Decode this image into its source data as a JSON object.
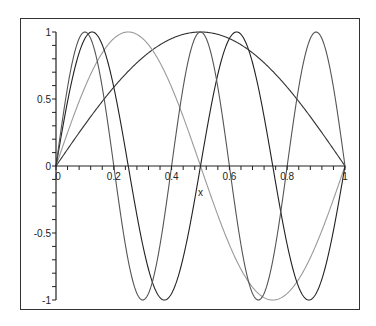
{
  "chart_data": {
    "type": "line",
    "title": "",
    "xlabel": "x",
    "ylabel": "",
    "xlim": [
      0,
      1
    ],
    "ylim": [
      -1,
      1
    ],
    "grid": false,
    "legend": null,
    "x_ticks": [
      {
        "value": 0,
        "label": "0"
      },
      {
        "value": 0.2,
        "label": "0.2"
      },
      {
        "value": 0.4,
        "label": "0.4"
      },
      {
        "value": 0.6,
        "label": "0.6"
      },
      {
        "value": 0.8,
        "label": "0.8"
      },
      {
        "value": 1,
        "label": "1"
      }
    ],
    "y_ticks": [
      {
        "value": 1,
        "label": "1"
      },
      {
        "value": 0.5,
        "label": "0.5"
      },
      {
        "value": 0,
        "label": "0"
      },
      {
        "value": -0.5,
        "label": "-0.5"
      },
      {
        "value": -1,
        "label": "-1"
      }
    ],
    "series": [
      {
        "name": "sin(pi x)",
        "n": 1,
        "color": "#333333",
        "x": [
          0,
          0.1,
          0.2,
          0.3,
          0.4,
          0.5,
          0.6,
          0.7,
          0.8,
          0.9,
          1
        ],
        "y": [
          0,
          0.309,
          0.588,
          0.809,
          0.951,
          1,
          0.951,
          0.809,
          0.588,
          0.309,
          0
        ]
      },
      {
        "name": "sin(2 pi x)",
        "n": 2,
        "color": "#9a9a9a",
        "x": [
          0,
          0.125,
          0.25,
          0.375,
          0.5,
          0.625,
          0.75,
          0.875,
          1
        ],
        "y": [
          0,
          0.707,
          1,
          0.707,
          0,
          -0.707,
          -1,
          -0.707,
          0
        ]
      },
      {
        "name": "sin(4 pi x)",
        "n": 4,
        "color": "#222222",
        "x": [
          0,
          0.125,
          0.25,
          0.375,
          0.5,
          0.625,
          0.75,
          0.875,
          1
        ],
        "y": [
          0,
          1,
          0,
          -1,
          0,
          1,
          0,
          -1,
          0
        ]
      },
      {
        "name": "sin(5 pi x)",
        "n": 5,
        "color": "#555555",
        "x": [
          0,
          0.1,
          0.2,
          0.3,
          0.4,
          0.5,
          0.6,
          0.7,
          0.8,
          0.9,
          1
        ],
        "y": [
          0,
          1,
          0,
          -1,
          0,
          1,
          0,
          -1,
          0,
          1,
          0
        ]
      }
    ]
  },
  "plot_box": {
    "x0": 56,
    "x1": 345,
    "y_top": 32,
    "y_bottom": 300
  }
}
